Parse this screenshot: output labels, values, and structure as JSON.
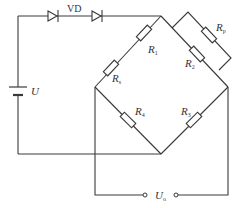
{
  "diagram": {
    "type": "bridge-circuit",
    "labels": {
      "diode": "VD",
      "source": "U",
      "r1": {
        "main": "R",
        "sub": "1"
      },
      "rs": {
        "main": "R",
        "sub": "s"
      },
      "r2": {
        "main": "R",
        "sub": "2"
      },
      "rp": {
        "main": "R",
        "sub": "p"
      },
      "r3": {
        "main": "R",
        "sub": "3"
      },
      "r4": {
        "main": "R",
        "sub": "4"
      },
      "output": {
        "main": "U",
        "sub": "o"
      }
    },
    "colors": {
      "line": "#3a3a3a",
      "text": "#333333",
      "background": "#ffffff"
    }
  }
}
